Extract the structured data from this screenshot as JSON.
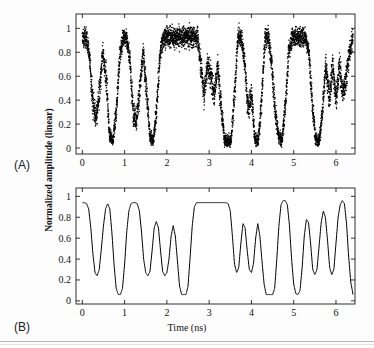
{
  "figure": {
    "panel_a_label": "(A)",
    "panel_b_label": "(B)",
    "ylabel": "Normalized amplitude (linear)",
    "xlabel": "Time (ns)"
  },
  "chart_data": [
    {
      "type": "scatter",
      "panel": "(A)",
      "title": "",
      "xlabel": "",
      "ylabel": "Normalized amplitude (linear)",
      "xlim": [
        -0.15,
        6.45
      ],
      "ylim": [
        -0.05,
        1.12
      ],
      "xticks": [
        0,
        1,
        2,
        3,
        4,
        5,
        6
      ],
      "xticklabels": [
        "0",
        "1",
        "2",
        "3",
        "4",
        "5",
        "6"
      ],
      "yticks": [
        0,
        0.2,
        0.4,
        0.6,
        0.8,
        1
      ],
      "yticklabels": [
        "0",
        "0.2",
        "0.4",
        "0.6",
        "0.8",
        "1"
      ],
      "grid": false,
      "legend": null,
      "marker_color": "#000000",
      "noise_amplitude": 0.07,
      "description": "Measured noisy eye-diagram style sampled waveform, dense black dots",
      "envelope_x": [
        0.0,
        0.08,
        0.16,
        0.24,
        0.32,
        0.4,
        0.48,
        0.56,
        0.64,
        0.72,
        0.8,
        0.88,
        0.96,
        1.04,
        1.12,
        1.2,
        1.28,
        1.36,
        1.44,
        1.52,
        1.6,
        1.68,
        1.76,
        1.84,
        1.92,
        2.0,
        2.08,
        2.16,
        2.24,
        2.32,
        2.4,
        2.48,
        2.56,
        2.64,
        2.72,
        2.8,
        2.88,
        2.96,
        3.04,
        3.12,
        3.2,
        3.28,
        3.36,
        3.44,
        3.52,
        3.6,
        3.68,
        3.76,
        3.84,
        3.92,
        4.0,
        4.08,
        4.16,
        4.24,
        4.32,
        4.4,
        4.48,
        4.56,
        4.64,
        4.72,
        4.8,
        4.88,
        4.96,
        5.04,
        5.12,
        5.2,
        5.28,
        5.36,
        5.44,
        5.52,
        5.6,
        5.68,
        5.76,
        5.84,
        5.92,
        6.0,
        6.08,
        6.16,
        6.24,
        6.32,
        6.4
      ],
      "envelope_y": [
        0.93,
        0.93,
        0.8,
        0.4,
        0.24,
        0.45,
        0.8,
        0.6,
        0.12,
        0.06,
        0.3,
        0.75,
        0.93,
        0.93,
        0.75,
        0.3,
        0.24,
        0.5,
        0.8,
        0.45,
        0.1,
        0.06,
        0.35,
        0.8,
        0.93,
        0.93,
        0.93,
        0.93,
        0.93,
        0.93,
        0.93,
        0.93,
        0.93,
        0.93,
        0.93,
        0.7,
        0.45,
        0.7,
        0.6,
        0.45,
        0.7,
        0.35,
        0.08,
        0.06,
        0.06,
        0.45,
        0.93,
        0.93,
        0.7,
        0.32,
        0.45,
        0.08,
        0.06,
        0.4,
        0.93,
        0.93,
        0.7,
        0.3,
        0.1,
        0.06,
        0.35,
        0.8,
        0.93,
        0.93,
        0.93,
        0.93,
        0.93,
        0.8,
        0.35,
        0.08,
        0.06,
        0.3,
        0.7,
        0.4,
        0.7,
        0.4,
        0.7,
        0.45,
        0.6,
        0.8,
        0.93
      ]
    },
    {
      "type": "line",
      "panel": "(B)",
      "title": "",
      "xlabel": "Time (ns)",
      "ylabel": "Normalized amplitude (linear)",
      "xlim": [
        -0.15,
        6.45
      ],
      "ylim": [
        -0.03,
        1.08
      ],
      "xticks": [
        0,
        1,
        2,
        3,
        4,
        5,
        6
      ],
      "xticklabels": [
        "0",
        "1",
        "2",
        "3",
        "4",
        "5",
        "6"
      ],
      "yticks": [
        0,
        0.2,
        0.4,
        0.6,
        0.8,
        1
      ],
      "yticklabels": [
        "0",
        "0.2",
        "0.4",
        "0.6",
        "0.8",
        "1"
      ],
      "grid": false,
      "legend": null,
      "line_color": "#000000",
      "line_width": 1,
      "description": "Simulated / filtered noise-free waveform, same bit pattern as panel A",
      "high_level": 0.94,
      "low_level": 0.055,
      "mid_level": 0.25,
      "x": [
        0.0,
        0.05,
        0.1,
        0.15,
        0.2,
        0.25,
        0.3,
        0.35,
        0.4,
        0.45,
        0.5,
        0.55,
        0.6,
        0.65,
        0.7,
        0.75,
        0.8,
        0.85,
        0.9,
        0.95,
        1.0,
        1.05,
        1.1,
        1.15,
        1.2,
        1.25,
        1.3,
        1.35,
        1.4,
        1.45,
        1.5,
        1.55,
        1.6,
        1.65,
        1.7,
        1.75,
        1.8,
        1.85,
        1.9,
        1.95,
        2.0,
        2.05,
        2.1,
        2.15,
        2.2,
        2.25,
        2.3,
        2.35,
        2.4,
        2.45,
        2.5,
        2.55,
        2.6,
        2.65,
        2.7,
        2.75,
        2.8,
        2.85,
        2.9,
        2.95,
        3.0,
        3.05,
        3.1,
        3.15,
        3.2,
        3.25,
        3.3,
        3.35,
        3.4,
        3.45,
        3.5,
        3.55,
        3.6,
        3.65,
        3.7,
        3.75,
        3.8,
        3.85,
        3.9,
        3.95,
        4.0,
        4.05,
        4.1,
        4.15,
        4.2,
        4.25,
        4.3,
        4.35,
        4.4,
        4.45,
        4.5,
        4.55,
        4.6,
        4.65,
        4.7,
        4.75,
        4.8,
        4.85,
        4.9,
        4.95,
        5.0,
        5.05,
        5.1,
        5.15,
        5.2,
        5.25,
        5.3,
        5.35,
        5.4,
        5.45,
        5.5,
        5.55,
        5.6,
        5.65,
        5.7,
        5.75,
        5.8,
        5.85,
        5.9,
        5.95,
        6.0,
        6.05,
        6.1,
        6.15,
        6.2,
        6.25,
        6.3,
        6.35,
        6.4
      ],
      "y": [
        0.94,
        0.94,
        0.93,
        0.88,
        0.7,
        0.45,
        0.27,
        0.24,
        0.3,
        0.5,
        0.72,
        0.88,
        0.93,
        0.88,
        0.65,
        0.35,
        0.12,
        0.06,
        0.06,
        0.12,
        0.35,
        0.66,
        0.86,
        0.93,
        0.94,
        0.94,
        0.93,
        0.86,
        0.66,
        0.4,
        0.27,
        0.24,
        0.28,
        0.48,
        0.7,
        0.76,
        0.7,
        0.48,
        0.28,
        0.24,
        0.27,
        0.4,
        0.62,
        0.72,
        0.62,
        0.38,
        0.14,
        0.06,
        0.06,
        0.06,
        0.14,
        0.42,
        0.72,
        0.9,
        0.94,
        0.94,
        0.94,
        0.94,
        0.94,
        0.94,
        0.94,
        0.94,
        0.94,
        0.94,
        0.94,
        0.94,
        0.94,
        0.94,
        0.94,
        0.93,
        0.86,
        0.62,
        0.35,
        0.27,
        0.32,
        0.55,
        0.74,
        0.7,
        0.48,
        0.3,
        0.27,
        0.36,
        0.6,
        0.74,
        0.62,
        0.38,
        0.16,
        0.06,
        0.06,
        0.06,
        0.06,
        0.12,
        0.4,
        0.72,
        0.92,
        0.96,
        0.96,
        0.92,
        0.72,
        0.4,
        0.16,
        0.07,
        0.06,
        0.1,
        0.32,
        0.62,
        0.78,
        0.75,
        0.55,
        0.3,
        0.25,
        0.3,
        0.52,
        0.75,
        0.86,
        0.8,
        0.58,
        0.32,
        0.25,
        0.3,
        0.55,
        0.8,
        0.92,
        0.96,
        0.93,
        0.74,
        0.42,
        0.18,
        0.07,
        0.06
      ]
    }
  ]
}
